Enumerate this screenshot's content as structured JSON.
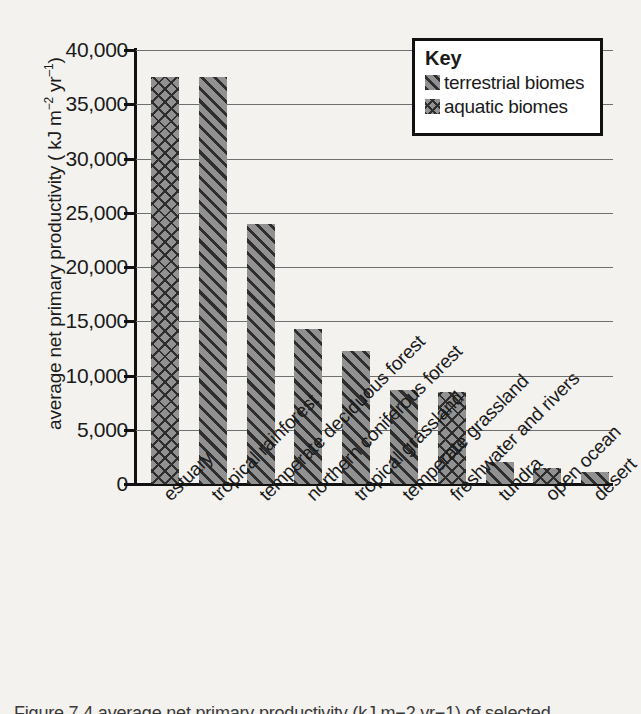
{
  "chart_data": {
    "type": "bar",
    "title": "",
    "xlabel": "",
    "ylabel": "average net primary productivity ( kJ m−2 yr−1)",
    "ylabel_parts": {
      "pre": "average net primary productivity ( kJ m",
      "sup1": "−2",
      "mid": " yr",
      "sup2": "–1",
      "post": ")"
    },
    "ylim": [
      0,
      40000
    ],
    "ytick_step": 5000,
    "ytick_labels": [
      "40,000",
      "35,000",
      "30,000",
      "25,000",
      "20,000",
      "15,000",
      "10,000",
      "5,000",
      "0"
    ],
    "ytick_values": [
      40000,
      35000,
      30000,
      25000,
      20000,
      15000,
      10000,
      5000,
      0
    ],
    "grid": true,
    "legend_position": "top-right",
    "categories": [
      "estuary",
      "tropical rainforest",
      "temperate deciduous forest",
      "northern coniferous forest",
      "tropical grassland",
      "temperate grassland",
      "freshwater and rivers",
      "tundra",
      "open ocean",
      "desert"
    ],
    "values": [
      37500,
      37500,
      24000,
      14300,
      12300,
      8700,
      8500,
      2000,
      1500,
      1100
    ],
    "groups": [
      "aquatic",
      "terrestrial",
      "terrestrial",
      "terrestrial",
      "terrestrial",
      "terrestrial",
      "aquatic",
      "terrestrial",
      "aquatic",
      "terrestrial"
    ],
    "series": [
      {
        "name": "terrestrial biomes",
        "pattern": "diagonal-hatch"
      },
      {
        "name": "aquatic biomes",
        "pattern": "cross-hatch"
      }
    ]
  },
  "legend": {
    "title": "Key",
    "items": [
      {
        "label": "terrestrial biomes",
        "pattern": "terrestrial"
      },
      {
        "label": "aquatic biomes",
        "pattern": "aquatic"
      }
    ]
  },
  "caption": "Figure 7.4  average net primary productivity (kJ m−2 yr−1) of selected",
  "colors": {
    "background": "#f3f2ef",
    "bar_fill": "#8d8d8d",
    "hatch": "#2e2e2e",
    "axis": "#111111",
    "gridline": "#6f6f6f",
    "legend_background": "#ffffff",
    "text": "#1a1a1a"
  }
}
